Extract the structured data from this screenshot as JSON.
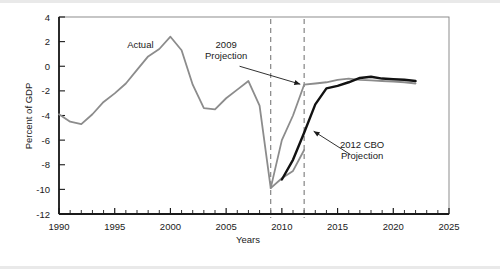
{
  "figure": {
    "name": "federal-budget-deficit-chart",
    "background_color": "#ffffff",
    "frame_color": "#808080"
  },
  "chart_data": {
    "type": "line",
    "title": "",
    "xlabel": "Years",
    "ylabel": "Percent of GDP",
    "xlim": [
      1990,
      2025
    ],
    "ylim": [
      -12,
      4
    ],
    "xticks": [
      1990,
      1991,
      1992,
      1993,
      1994,
      1995,
      1996,
      1997,
      1998,
      1999,
      2000,
      2001,
      2002,
      2003,
      2004,
      2005,
      2006,
      2007,
      2008,
      2009,
      2010,
      2011,
      2012,
      2013,
      2014,
      2015,
      2016,
      2017,
      2018,
      2019,
      2020,
      2021,
      2022,
      2023,
      2024,
      2025
    ],
    "xtick_labels": [
      "1990",
      "1995",
      "2000",
      "2005",
      "2010",
      "2015",
      "2020",
      "2025"
    ],
    "xtick_label_values": [
      1990,
      1995,
      2000,
      2005,
      2010,
      2015,
      2020,
      2025
    ],
    "yticks": [
      4,
      2,
      0,
      -2,
      -4,
      -6,
      -8,
      -10,
      -12
    ],
    "ytick_labels": [
      "4",
      "2",
      "0",
      "-2",
      "-4",
      "-6",
      "-8",
      "-10",
      "-12"
    ],
    "grid": false,
    "legend": "inline-annotations",
    "series": [
      {
        "name": "Actual",
        "color": "#8c8c8c",
        "width": 1.8,
        "style": "solid",
        "points": [
          [
            1990,
            -3.9
          ],
          [
            1991,
            -4.5
          ],
          [
            1992,
            -4.7
          ],
          [
            1993,
            -3.9
          ],
          [
            1994,
            -2.9
          ],
          [
            1995,
            -2.2
          ],
          [
            1996,
            -1.4
          ],
          [
            1997,
            -0.3
          ],
          [
            1998,
            0.8
          ],
          [
            1999,
            1.4
          ],
          [
            2000,
            2.4
          ],
          [
            2001,
            1.3
          ],
          [
            2002,
            -1.5
          ],
          [
            2003,
            -3.4
          ],
          [
            2004,
            -3.5
          ],
          [
            2005,
            -2.6
          ],
          [
            2006,
            -1.9
          ],
          [
            2007,
            -1.2
          ],
          [
            2008,
            -3.2
          ],
          [
            2009,
            -9.9
          ],
          [
            2010,
            -9.1
          ],
          [
            2011,
            -8.5
          ],
          [
            2012,
            -6.8
          ]
        ]
      },
      {
        "name": "2009 Projection",
        "color": "#8c8c8c",
        "width": 1.8,
        "style": "solid",
        "points": [
          [
            2009,
            -9.9
          ],
          [
            2010,
            -6.0
          ],
          [
            2011,
            -4.0
          ],
          [
            2012,
            -1.5
          ],
          [
            2013,
            -1.4
          ],
          [
            2014,
            -1.3
          ],
          [
            2015,
            -1.1
          ],
          [
            2016,
            -1.0
          ],
          [
            2017,
            -1.1
          ],
          [
            2018,
            -1.15
          ],
          [
            2019,
            -1.2
          ],
          [
            2020,
            -1.25
          ],
          [
            2021,
            -1.3
          ],
          [
            2022,
            -1.4
          ]
        ]
      },
      {
        "name": "2012 CBO Projection",
        "color": "#121212",
        "width": 2.4,
        "style": "solid",
        "points": [
          [
            2010,
            -9.2
          ],
          [
            2011,
            -7.6
          ],
          [
            2012,
            -5.4
          ],
          [
            2013,
            -3.1
          ],
          [
            2014,
            -1.8
          ],
          [
            2015,
            -1.6
          ],
          [
            2016,
            -1.3
          ],
          [
            2017,
            -0.95
          ],
          [
            2018,
            -0.85
          ],
          [
            2019,
            -1.0
          ],
          [
            2020,
            -1.05
          ],
          [
            2021,
            -1.1
          ],
          [
            2022,
            -1.2
          ]
        ]
      }
    ],
    "reference_lines": [
      {
        "name": "2009-marker",
        "x": 2009,
        "style": "dashed",
        "color": "#7a7a7a"
      },
      {
        "name": "2012-marker",
        "x": 2012,
        "style": "dashed",
        "color": "#7a7a7a"
      }
    ],
    "annotations": [
      {
        "name": "actual-label",
        "text": "Actual",
        "lines": [
          "Actual"
        ],
        "x": 1997.3,
        "y": 1.45,
        "anchor": "middle",
        "arrow": false
      },
      {
        "name": "projection-2009-label",
        "text": "2009 Projection",
        "lines": [
          "2009",
          "Projection"
        ],
        "x": 2005.0,
        "y": 1.5,
        "anchor": "middle",
        "arrow": true,
        "arrow_to_x": 2012.0,
        "arrow_to_y": -1.55
      },
      {
        "name": "projection-2012-cbo-label",
        "text": "2012 CBO Projection",
        "lines": [
          "2012 CBO",
          "Projection"
        ],
        "x": 2017.2,
        "y": -6.6,
        "anchor": "middle",
        "arrow": true,
        "arrow_to_x": 2012.55,
        "arrow_to_y": -5.1
      }
    ]
  }
}
